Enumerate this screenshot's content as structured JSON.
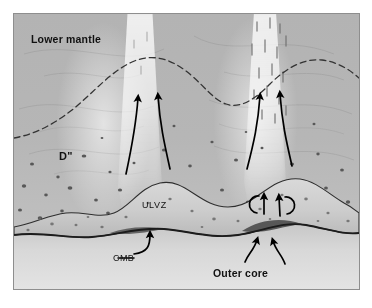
{
  "figure": {
    "type": "geoscience-cross-section",
    "background_color": "#ffffff",
    "panel_border_color": "#8e8e8e",
    "panel_background_color": "#b0b0b0"
  },
  "labels": {
    "lower_mantle": "Lower mantle",
    "d_double_prime": "D\"",
    "ulvz": "ULVZ",
    "cmb": "CMB",
    "outer_core": "Outer core"
  },
  "layers": [
    {
      "name": "lower-mantle",
      "label": "Lower mantle",
      "fill": "#b4b4b4"
    },
    {
      "name": "d-double-prime",
      "label": "D\"",
      "fill": "#bdbdbd",
      "texture": "dark-speckled-inclusions"
    },
    {
      "name": "ulvz",
      "label": "ULVZ",
      "fill": "#d2d2d2",
      "texture": "speckled"
    },
    {
      "name": "outer-core",
      "label": "Outer core",
      "fill": "#d8d8d8"
    }
  ],
  "boundaries": [
    {
      "name": "d-double-prime-discontinuity",
      "style": "dashed",
      "color": "#3a3a3a"
    },
    {
      "name": "ulvz-top-boundary",
      "style": "solid",
      "color": "#2b2b2b"
    },
    {
      "name": "core-mantle-boundary",
      "style": "solid-thick",
      "color": "#1a1a1a"
    }
  ],
  "features": {
    "plumes": [
      {
        "name": "plume-left",
        "streaked": false
      },
      {
        "name": "plume-right",
        "streaked": true
      }
    ],
    "plume_arrows": 4,
    "circulation_loops": 2,
    "core_inflow_arrows": 2,
    "cmb_pointer_arrows": 1
  },
  "colors": {
    "ink": "#111111",
    "arrow": "#000000",
    "speckle": "#5c5c5c",
    "plume_highlight": "#ffffff"
  }
}
